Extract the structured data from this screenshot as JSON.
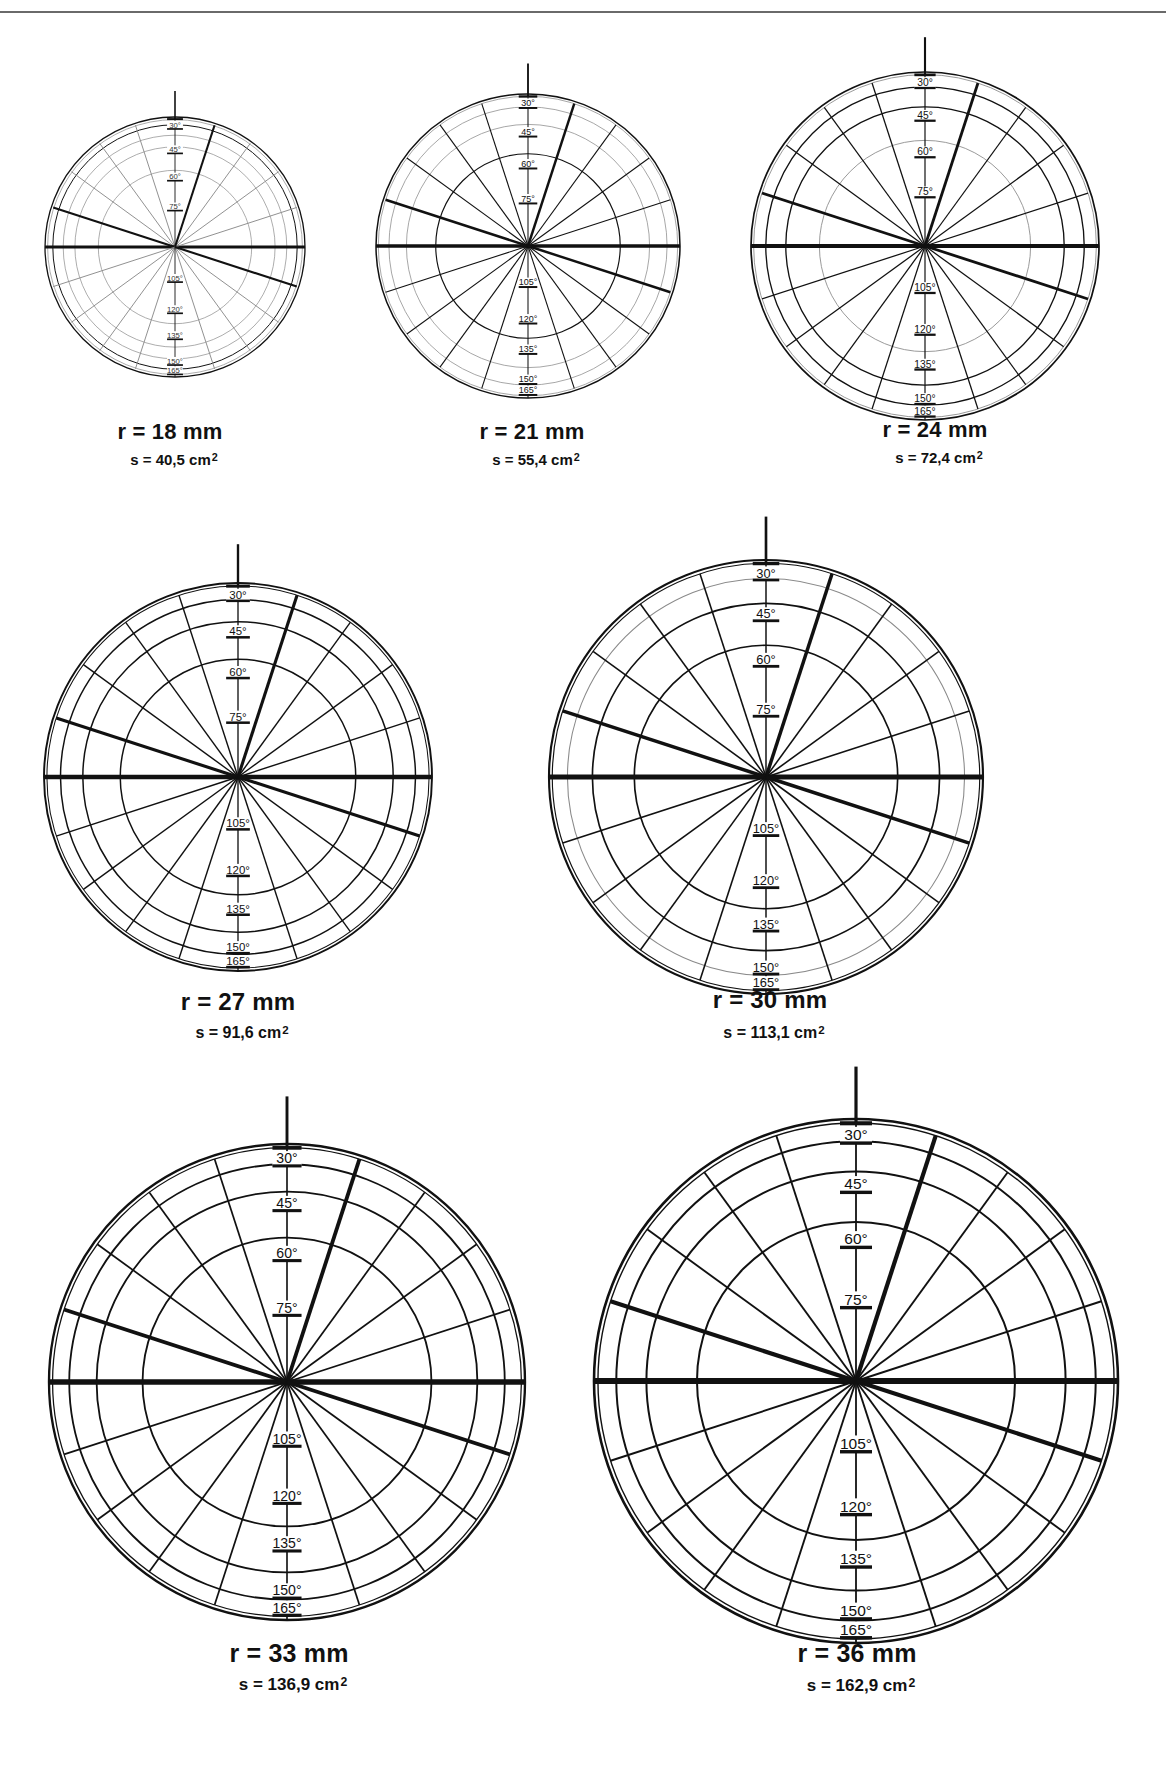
{
  "header": {
    "cut_text": ""
  },
  "scale_labels_top": [
    "30°",
    "45°",
    "60°",
    "75°"
  ],
  "scale_labels_bottom": [
    "105°",
    "120°",
    "135°",
    "150°",
    "165°"
  ],
  "diagrams": [
    {
      "id": "r18",
      "radius_label": "r = 18 mm",
      "area_label": "s = 40,5 cm",
      "area_sup": "2",
      "cx": 175,
      "cy": 247,
      "R": 130,
      "cap_y": 441,
      "s_y": 466,
      "cap_x": 170,
      "cap_size": 22,
      "s_size": 15,
      "gray_rings": [
        0.98,
        0.86,
        0.77,
        0.59
      ],
      "dark_rings": [
        0.94
      ],
      "thin_spokes_gray": true
    },
    {
      "id": "r21",
      "radius_label": "r = 21 mm",
      "area_label": "s = 55,4 cm",
      "area_sup": "2",
      "cx": 528,
      "cy": 246,
      "R": 152,
      "cap_y": 441,
      "s_y": 466,
      "cap_x": 532,
      "cap_size": 22,
      "s_size": 15,
      "gray_rings": [
        0.985,
        0.915,
        0.8
      ],
      "dark_rings": [
        0.607
      ],
      "thin_spokes_gray": false
    },
    {
      "id": "r24",
      "radius_label": "r = 24 mm",
      "area_label": "s = 72,4 cm",
      "area_sup": "2",
      "cx": 925,
      "cy": 246,
      "R": 174,
      "cap_y": 439,
      "s_y": 464,
      "cap_x": 935,
      "cap_size": 22,
      "s_size": 15,
      "gray_rings": [
        0.985,
        0.607
      ],
      "dark_rings": [
        0.915,
        0.8
      ],
      "thin_spokes_gray": false
    },
    {
      "id": "r27",
      "radius_label": "r = 27 mm",
      "area_label": "s = 91,6 cm",
      "area_sup": "2",
      "cx": 238,
      "cy": 777,
      "R": 194,
      "cap_y": 1012,
      "s_y": 1040,
      "cap_x": 238,
      "cap_size": 24,
      "s_size": 16,
      "gray_rings": [],
      "dark_rings": [
        0.985,
        0.915,
        0.8,
        0.607
      ],
      "thin_spokes_gray": false
    },
    {
      "id": "r30",
      "radius_label": "r = 30 mm",
      "area_label": "s = 113,1 cm",
      "area_sup": "2",
      "cx": 766,
      "cy": 777,
      "R": 217,
      "cap_y": 1010,
      "s_y": 1040,
      "cap_x": 770,
      "cap_size": 24,
      "s_size": 16,
      "gray_rings": [
        0.915
      ],
      "dark_rings": [
        0.985,
        0.8,
        0.607
      ],
      "thin_spokes_gray": false
    },
    {
      "id": "r33",
      "radius_label": "r = 33 mm",
      "area_label": "s = 136,9 cm",
      "area_sup": "2",
      "cx": 287,
      "cy": 1382,
      "R": 238,
      "cap_y": 1664,
      "s_y": 1692,
      "cap_x": 289,
      "cap_size": 25,
      "s_size": 17,
      "gray_rings": [],
      "dark_rings": [
        0.985,
        0.915,
        0.8,
        0.607
      ],
      "thin_spokes_gray": false
    },
    {
      "id": "r36",
      "radius_label": "r = 36 mm",
      "area_label": "s = 162,9 cm",
      "area_sup": "2",
      "cx": 856,
      "cy": 1381,
      "R": 262,
      "cap_y": 1664,
      "s_y": 1693,
      "cap_x": 857,
      "cap_size": 25,
      "s_size": 17,
      "gray_rings": [],
      "dark_rings": [
        0.985,
        0.915,
        0.8,
        0.607
      ],
      "thin_spokes_gray": false
    }
  ],
  "chart_data": {
    "type": "diagram",
    "title": "",
    "spokes_every_deg": 18,
    "thick_spokes_deg": [
      0,
      180,
      72,
      162,
      342
    ],
    "scale_marks": {
      "top": [
        {
          "label": "30°",
          "frac": 0.908
        },
        {
          "label": "45°",
          "frac": 0.72
        },
        {
          "label": "60°",
          "frac": 0.51
        },
        {
          "label": "75°",
          "frac": 0.28
        }
      ],
      "bottom": [
        {
          "label": "105°",
          "frac": 0.27
        },
        {
          "label": "120°",
          "frac": 0.51
        },
        {
          "label": "135°",
          "frac": 0.71
        },
        {
          "label": "150°",
          "frac": 0.908
        },
        {
          "label": "165°",
          "frac": 0.98
        }
      ]
    },
    "items": [
      {
        "r_mm": 18,
        "s_cm2": 40.5
      },
      {
        "r_mm": 21,
        "s_cm2": 55.4
      },
      {
        "r_mm": 24,
        "s_cm2": 72.4
      },
      {
        "r_mm": 27,
        "s_cm2": 91.6
      },
      {
        "r_mm": 30,
        "s_cm2": 113.1
      },
      {
        "r_mm": 33,
        "s_cm2": 136.9
      },
      {
        "r_mm": 36,
        "s_cm2": 162.9
      }
    ]
  }
}
